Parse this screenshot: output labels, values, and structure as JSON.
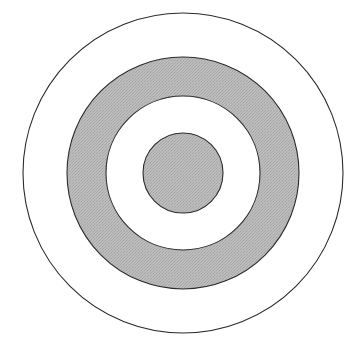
{
  "figure": {
    "canvas": {
      "width": 351,
      "height": 349,
      "background_color": "#ffffff"
    },
    "center": {
      "x": 183,
      "y": 173
    },
    "colors": {
      "shaded_fill": "#b6b6b6",
      "plain_fill": "#ffffff",
      "outline": "#2b2b2b",
      "background": "#ffffff"
    },
    "stroke_width": 1.1,
    "bands": [
      {
        "name": "outer-band",
        "label": "Outer white band",
        "fill_kind": "plain",
        "fill_color": "#ffffff",
        "outer_radius": 160,
        "inner_radius": 116
      },
      {
        "name": "shaded-annulus",
        "label": "Shaded gray annulus",
        "fill_kind": "shaded",
        "fill_color": "#b6b6b6",
        "outer_radius": 116,
        "inner_radius": 77
      },
      {
        "name": "inner-white-band",
        "label": "Inner white band",
        "fill_kind": "plain",
        "fill_color": "#ffffff",
        "outer_radius": 77,
        "inner_radius": 40
      },
      {
        "name": "center-disc",
        "label": "Center shaded disc",
        "fill_kind": "shaded",
        "fill_color": "#b6b6b6",
        "outer_radius": 40,
        "inner_radius": 0
      }
    ],
    "circles": [
      {
        "name": "circle-outer",
        "radius": 160,
        "fill": "#ffffff",
        "stroke": "#2b2b2b"
      },
      {
        "name": "circle-shaded-outer",
        "radius": 116,
        "fill": "#b6b6b6",
        "stroke": "#2b2b2b"
      },
      {
        "name": "circle-shaded-inner",
        "radius": 77,
        "fill": "#ffffff",
        "stroke": "#2b2b2b"
      },
      {
        "name": "circle-center",
        "radius": 40,
        "fill": "#b6b6b6",
        "stroke": "#2b2b2b"
      }
    ]
  }
}
